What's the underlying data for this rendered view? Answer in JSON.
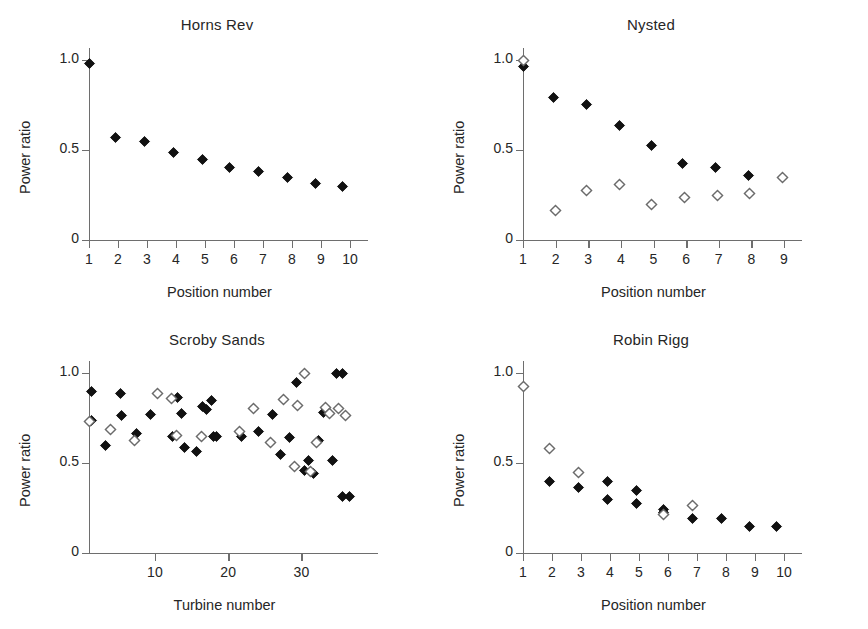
{
  "figure": {
    "background": "#ffffff",
    "marker_filled_color": "#111111",
    "marker_open_color": "#6b6b6b",
    "axis_color": "#6e6e6e"
  },
  "chart_data": [
    {
      "type": "scatter",
      "title": "Horns Rev",
      "xlabel": "Position number",
      "ylabel": "Power ratio",
      "xlim": [
        1,
        10
      ],
      "ylim": [
        0,
        1.05
      ],
      "xticks": [
        1,
        2,
        3,
        4,
        5,
        6,
        7,
        8,
        9,
        10
      ],
      "xtick_labels": [
        "1",
        "2",
        "3",
        "4",
        "5",
        "6",
        "7",
        "8",
        "9",
        "10"
      ],
      "yticks": [
        0,
        0.5,
        1.0
      ],
      "ytick_labels": [
        "0",
        "0.5",
        "1.0"
      ],
      "grid": false,
      "legend": "none",
      "series": [
        {
          "name": "observed",
          "marker": "filled-diamond",
          "x": [
            1,
            1.9,
            2.9,
            3.9,
            4.9,
            5.85,
            6.85,
            7.85,
            8.8,
            9.75
          ],
          "values": [
            0.98,
            0.57,
            0.545,
            0.485,
            0.45,
            0.405,
            0.38,
            0.35,
            0.315,
            0.3
          ]
        }
      ]
    },
    {
      "type": "scatter",
      "title": "Nysted",
      "xlabel": "Position number",
      "ylabel": "Power ratio",
      "xlim": [
        1,
        9
      ],
      "ylim": [
        0,
        1.05
      ],
      "xticks": [
        1,
        2,
        3,
        4,
        5,
        6,
        7,
        8,
        9
      ],
      "xtick_labels": [
        "1",
        "2",
        "3",
        "4",
        "5",
        "6",
        "7",
        "8",
        "9"
      ],
      "yticks": [
        0,
        0.5,
        1.0
      ],
      "ytick_labels": [
        "0",
        "0.5",
        "1.0"
      ],
      "grid": false,
      "legend": "none",
      "series": [
        {
          "name": "filled",
          "marker": "filled-diamond",
          "x": [
            1.0,
            1.95,
            2.95,
            3.95,
            4.95,
            5.9,
            6.9,
            7.9
          ],
          "values": [
            0.965,
            0.79,
            0.755,
            0.635,
            0.525,
            0.425,
            0.405,
            0.36
          ]
        },
        {
          "name": "open",
          "marker": "open-diamond",
          "x": [
            1.0,
            2.0,
            2.95,
            3.95,
            4.95,
            5.95,
            6.95,
            7.95,
            8.95
          ],
          "values": [
            1.0,
            0.165,
            0.275,
            0.31,
            0.195,
            0.235,
            0.245,
            0.26,
            0.35
          ]
        }
      ]
    },
    {
      "type": "scatter",
      "title": "Scroby Sands",
      "xlabel": "Turbine number",
      "ylabel": "Power ratio",
      "xlim": [
        1,
        38
      ],
      "ylim": [
        0,
        1.05
      ],
      "xticks": [
        10,
        20,
        30
      ],
      "xtick_labels": [
        "10",
        "20",
        "30"
      ],
      "yticks": [
        0,
        0.5,
        1.0
      ],
      "ytick_labels": [
        "0",
        "0.5",
        "1.0"
      ],
      "grid": false,
      "legend": "none",
      "series": [
        {
          "name": "filled",
          "marker": "filled-diamond",
          "x": [
            1.3,
            1.3,
            3.2,
            5.3,
            5.4,
            7.5,
            9.4,
            12.4,
            13.1,
            13.6,
            14.0,
            15.7,
            16.5,
            17.1,
            17.7,
            18.0,
            18.4,
            21.8,
            24.2,
            26.0,
            27.2,
            28.4,
            29.3,
            30.4,
            31.0,
            31.6,
            32.3,
            33.0,
            34.2,
            34.8,
            35.6,
            35.6,
            36.6
          ],
          "values": [
            0.895,
            0.735,
            0.6,
            0.885,
            0.765,
            0.665,
            0.77,
            0.645,
            0.865,
            0.775,
            0.585,
            0.565,
            0.815,
            0.8,
            0.845,
            0.645,
            0.645,
            0.645,
            0.675,
            0.77,
            0.545,
            0.64,
            0.945,
            0.46,
            0.515,
            0.44,
            0.625,
            0.78,
            0.515,
            1.0,
            1.0,
            0.315,
            0.315
          ]
        },
        {
          "name": "open",
          "marker": "open-diamond",
          "x": [
            1.0,
            4.0,
            7.2,
            10.3,
            12.2,
            13.0,
            16.4,
            21.5,
            23.5,
            25.8,
            27.6,
            29.0,
            29.4,
            30.4,
            31.3,
            32.0,
            33.3,
            33.9,
            35.0,
            36.0
          ],
          "values": [
            0.73,
            0.685,
            0.625,
            0.885,
            0.86,
            0.655,
            0.645,
            0.675,
            0.805,
            0.615,
            0.855,
            0.48,
            0.82,
            1.0,
            0.455,
            0.615,
            0.81,
            0.775,
            0.805,
            0.765
          ]
        }
      ]
    },
    {
      "type": "scatter",
      "title": "Robin Rigg",
      "xlabel": "Position number",
      "ylabel": "Power ratio",
      "xlim": [
        1,
        10
      ],
      "ylim": [
        0,
        1.05
      ],
      "xticks": [
        1,
        2,
        3,
        4,
        5,
        6,
        7,
        8,
        9,
        10
      ],
      "xtick_labels": [
        "1",
        "2",
        "3",
        "4",
        "5",
        "6",
        "7",
        "8",
        "9",
        "10"
      ],
      "yticks": [
        0,
        0.5,
        1.0
      ],
      "ytick_labels": [
        "0",
        "0.5",
        "1.0"
      ],
      "grid": false,
      "legend": "none",
      "series": [
        {
          "name": "filled",
          "marker": "filled-diamond",
          "x": [
            1.9,
            2.9,
            3.9,
            3.9,
            4.9,
            4.9,
            5.85,
            5.85,
            6.85,
            7.85,
            8.8,
            9.75
          ],
          "values": [
            0.395,
            0.365,
            0.395,
            0.3,
            0.35,
            0.275,
            0.24,
            0.225,
            0.19,
            0.19,
            0.15,
            0.15
          ]
        },
        {
          "name": "open",
          "marker": "open-diamond",
          "x": [
            1.0,
            1.9,
            2.9,
            5.85,
            6.85
          ],
          "values": [
            0.925,
            0.58,
            0.445,
            0.215,
            0.265
          ]
        }
      ]
    }
  ]
}
